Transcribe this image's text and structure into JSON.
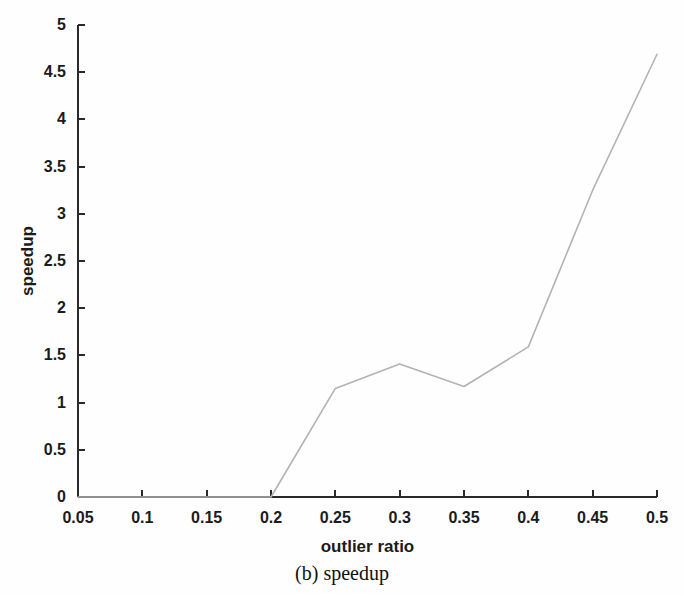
{
  "figure": {
    "caption": "(b) speedup",
    "background_color": "#fefefe"
  },
  "chart_data": {
    "type": "line",
    "title": "",
    "subtitle": "",
    "xlabel": "outlier ratio",
    "ylabel": "speedup",
    "x": [
      0.05,
      0.1,
      0.15,
      0.2,
      0.25,
      0.3,
      0.35,
      0.4,
      0.45,
      0.5
    ],
    "values": [
      0,
      0,
      0,
      0,
      1.15,
      1.41,
      1.17,
      1.59,
      3.25,
      4.69
    ],
    "series": [
      {
        "name": "speedup",
        "values": [
          0,
          0,
          0,
          0,
          1.15,
          1.41,
          1.17,
          1.59,
          3.25,
          4.69
        ],
        "color": "#b3b3b3"
      }
    ],
    "xlim": [
      0.05,
      0.5
    ],
    "ylim": [
      0,
      5
    ],
    "xticks": [
      0.05,
      0.1,
      0.15,
      0.2,
      0.25,
      0.3,
      0.35,
      0.4,
      0.45,
      0.5
    ],
    "xtick_labels": [
      "0.05",
      "0.1",
      "0.15",
      "0.2",
      "0.25",
      "0.3",
      "0.35",
      "0.4",
      "0.45",
      "0.5"
    ],
    "yticks": [
      0,
      0.5,
      1,
      1.5,
      2,
      2.5,
      3,
      3.5,
      4,
      4.5,
      5
    ],
    "ytick_labels": [
      "0",
      "0.5",
      "1",
      "1.5",
      "2",
      "2.5",
      "3",
      "3.5",
      "4",
      "4.5",
      "5"
    ],
    "grid": false,
    "legend": null,
    "legend_position": "none",
    "annotations": [],
    "line_color": "#b3b3b3",
    "line_width": 1.6,
    "axis_color": "#2a2a2a"
  }
}
